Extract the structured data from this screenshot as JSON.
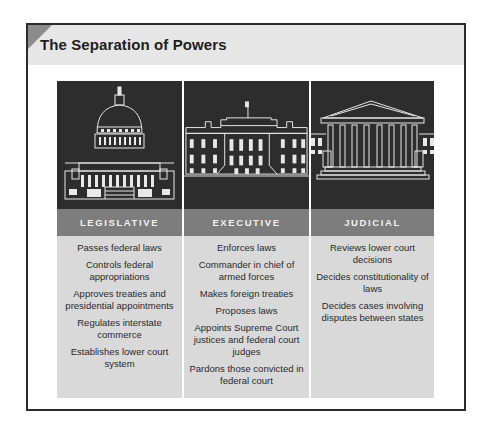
{
  "title": "The Separation of Powers",
  "colors": {
    "frame_border": "#2c2c2c",
    "title_band": "#e6e6e6",
    "corner_tab": "#8c8c8c",
    "illustration_bg": "#2d2d2d",
    "branch_header_bg": "#7d7d7d",
    "branch_body_bg": "#d9d9d9"
  },
  "branches": [
    {
      "name": "LEGISLATIVE",
      "icon": "capitol-building-icon",
      "powers": [
        "Passes federal laws",
        "Controls federal appropriations",
        "Approves treaties and presidential appointments",
        "Regulates interstate commerce",
        "Establishes lower court system"
      ]
    },
    {
      "name": "EXECUTIVE",
      "icon": "white-house-icon",
      "powers": [
        "Enforces laws",
        "Commander in chief of armed forces",
        "Makes foreign treaties",
        "Proposes laws",
        "Appoints Supreme Court justices and federal court judges",
        "Pardons those convicted in federal court"
      ]
    },
    {
      "name": "JUDICIAL",
      "icon": "supreme-court-icon",
      "powers": [
        "Reviews lower court decisions",
        "Decides constitutionality of laws",
        "Decides cases involving disputes between states"
      ]
    }
  ]
}
